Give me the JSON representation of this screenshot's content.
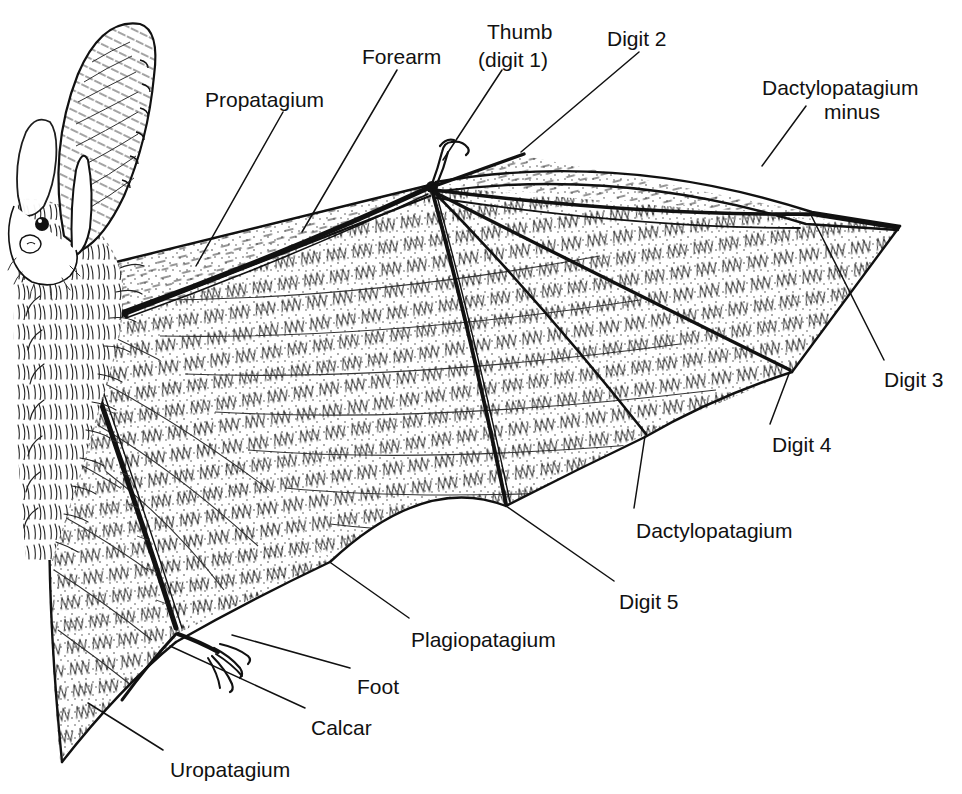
{
  "figure": {
    "title_text": "",
    "background_color": "#ffffff",
    "ink_color": "#111111",
    "line_color": "#1a1a1a"
  },
  "labels": [
    {
      "id": "propatagium",
      "text": "Propatagium",
      "x": 205,
      "y": 88,
      "align": "left"
    },
    {
      "id": "forearm",
      "text": "Forearm",
      "x": 362,
      "y": 45,
      "align": "left"
    },
    {
      "id": "thumb_line1",
      "text": "Thumb",
      "x": 487,
      "y": 20,
      "align": "left"
    },
    {
      "id": "thumb_line2",
      "text": "(digit 1)",
      "x": 478,
      "y": 48,
      "align": "left"
    },
    {
      "id": "digit2",
      "text": "Digit 2",
      "x": 607,
      "y": 27,
      "align": "left"
    },
    {
      "id": "dactylopatagium_minus1",
      "text": "Dactylopatagium",
      "x": 762,
      "y": 76,
      "align": "left"
    },
    {
      "id": "dactylopatagium_minus2",
      "text": "minus",
      "x": 824,
      "y": 100,
      "align": "left"
    },
    {
      "id": "digit3",
      "text": "Digit 3",
      "x": 884,
      "y": 368,
      "align": "left"
    },
    {
      "id": "digit4",
      "text": "Digit 4",
      "x": 772,
      "y": 433,
      "align": "left"
    },
    {
      "id": "dactylopatagium",
      "text": "Dactylopatagium",
      "x": 636,
      "y": 519,
      "align": "left"
    },
    {
      "id": "digit5",
      "text": "Digit 5",
      "x": 619,
      "y": 590,
      "align": "left"
    },
    {
      "id": "plagiopatagium",
      "text": "Plagiopatagium",
      "x": 411,
      "y": 628,
      "align": "left"
    },
    {
      "id": "foot",
      "text": "Foot",
      "x": 357,
      "y": 675,
      "align": "left"
    },
    {
      "id": "calcar",
      "text": "Calcar",
      "x": 311,
      "y": 716,
      "align": "left"
    },
    {
      "id": "uropatagium",
      "text": "Uropatagium",
      "x": 170,
      "y": 758,
      "align": "left"
    }
  ],
  "leader_lines": [
    {
      "id": "leader-propatagium",
      "from": [
        283,
        112
      ],
      "to": [
        196,
        266
      ]
    },
    {
      "id": "leader-forearm",
      "from": [
        397,
        70
      ],
      "to": [
        302,
        232
      ]
    },
    {
      "id": "leader-thumb",
      "from": [
        502,
        70
      ],
      "to": [
        443,
        160
      ]
    },
    {
      "id": "leader-digit2",
      "from": [
        639,
        52
      ],
      "to": [
        521,
        152
      ]
    },
    {
      "id": "leader-dactylopatagium-minus",
      "from": [
        806,
        106
      ],
      "to": [
        762,
        166
      ]
    },
    {
      "id": "leader-digit3",
      "from": [
        884,
        360
      ],
      "to": [
        810,
        213
      ]
    },
    {
      "id": "leader-digit4",
      "from": [
        770,
        424
      ],
      "to": [
        790,
        371
      ]
    },
    {
      "id": "leader-dactylopatagium",
      "from": [
        634,
        508
      ],
      "to": [
        645,
        436
      ]
    },
    {
      "id": "leader-digit5",
      "from": [
        614,
        581
      ],
      "to": [
        506,
        506
      ]
    },
    {
      "id": "leader-plagiopatagium",
      "from": [
        409,
        618
      ],
      "to": [
        331,
        563
      ]
    },
    {
      "id": "leader-foot",
      "from": [
        350,
        668
      ],
      "to": [
        232,
        635
      ]
    },
    {
      "id": "leader-calcar",
      "from": [
        305,
        708
      ],
      "to": [
        170,
        646
      ]
    },
    {
      "id": "leader-uropatagium",
      "from": [
        163,
        750
      ],
      "to": [
        88,
        703
      ]
    }
  ],
  "anatomy_parts": [
    "head",
    "ear-left",
    "ear-right",
    "tragus",
    "eye",
    "snout",
    "body-fur",
    "forearm-bone",
    "thumb-claw",
    "digit-2-bone",
    "digit-3-bone",
    "digit-4-bone",
    "digit-5-bone",
    "wing-membrane",
    "propatagium-membrane",
    "plagiopatagium-membrane",
    "uropatagium-membrane",
    "leg",
    "foot-claws",
    "calcar-spur"
  ]
}
